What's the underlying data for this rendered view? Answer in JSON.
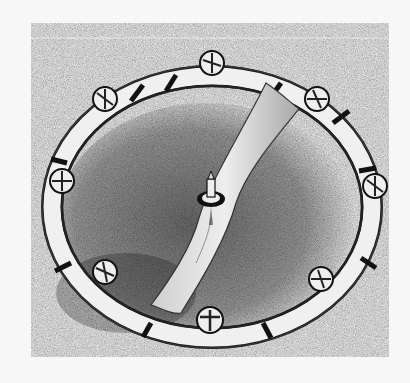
{
  "image": {
    "subject": "balance wheel ring with screws and central arm",
    "style": "halftone black-and-white photograph",
    "colors": {
      "page": "#f7f7f7",
      "background_texture": "#8a8a8a",
      "shadow": "#3a3a3a",
      "metal_light": "#f2f2f2",
      "metal_dark": "#1a1a1a"
    },
    "screw_count": 8
  }
}
